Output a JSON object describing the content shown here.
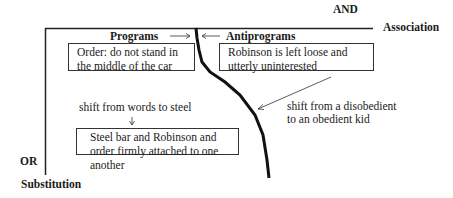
{
  "axes": {
    "horizontal_top": "AND",
    "horizontal_right": "Association",
    "vertical_left": "OR",
    "vertical_bottom": "Substitution"
  },
  "columns": {
    "programs": "Programs",
    "antiprograms": "Antiprograms"
  },
  "boxes": {
    "order": "Order: do not stand in the middle of the car",
    "robinson": "Robinson is left loose and utterly uninterested",
    "steel": "Steel bar and Robinson and order firmly attached to one another"
  },
  "annotations": {
    "shift_words_steel": "shift from words to steel",
    "shift_kid": "shift from a disobedient to an obedient kid"
  }
}
